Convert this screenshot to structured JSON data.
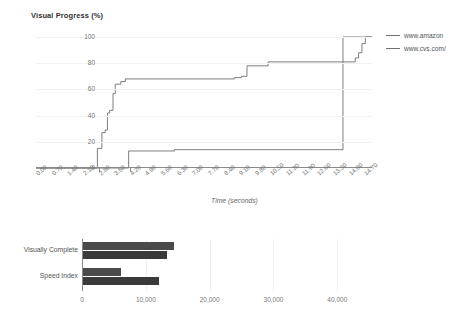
{
  "line_chart": {
    "title": "Visual Progress (%)",
    "xlabel": "Time (seconds)",
    "legend": [
      {
        "label": "www.amazon",
        "color": "#6f6f6f"
      },
      {
        "label": "www.cvs.com/",
        "color": "#6f6f6f"
      }
    ]
  },
  "bar_chart": {
    "title": "Timings (ms)",
    "legend": [
      {
        "label": "www.amaz...",
        "color": "#4a4a4a"
      },
      {
        "label": "www.cvs.co...",
        "color": "#3a3a3a"
      }
    ]
  },
  "chart_data": [
    {
      "type": "line",
      "title": "Visual Progress (%)",
      "xlabel": "Time (seconds)",
      "ylabel": "",
      "xlim": [
        0.0,
        15.05
      ],
      "ylim": [
        0,
        100
      ],
      "grid": true,
      "legend_position": "right",
      "xticks": [
        "0.00",
        "0.70",
        "1.40",
        "2.10",
        "2.80",
        "3.50",
        "4.20",
        "4.90",
        "5.60",
        "6.30",
        "7.00",
        "7.70",
        "8.40",
        "9.10",
        "9.80",
        "10.50",
        "11.20",
        "11.90",
        "12.60",
        "13.30",
        "14.00",
        "14.70"
      ],
      "yticks": [
        0,
        20,
        40,
        60,
        80,
        100
      ],
      "series": [
        {
          "name": "www.amazon",
          "color": "#6f6f6f",
          "step": "post",
          "points": [
            [
              0.0,
              0
            ],
            [
              2.75,
              0
            ],
            [
              2.75,
              15
            ],
            [
              2.95,
              15
            ],
            [
              2.95,
              27
            ],
            [
              3.1,
              27
            ],
            [
              3.1,
              29
            ],
            [
              3.2,
              29
            ],
            [
              3.2,
              42
            ],
            [
              3.3,
              42
            ],
            [
              3.3,
              44
            ],
            [
              3.45,
              44
            ],
            [
              3.45,
              57
            ],
            [
              3.55,
              57
            ],
            [
              3.55,
              64
            ],
            [
              3.8,
              64
            ],
            [
              3.8,
              66
            ],
            [
              4.0,
              66
            ],
            [
              4.0,
              68
            ],
            [
              8.9,
              68
            ],
            [
              8.9,
              69
            ],
            [
              9.2,
              69
            ],
            [
              9.2,
              70
            ],
            [
              9.45,
              70
            ],
            [
              9.45,
              78
            ],
            [
              10.4,
              78
            ],
            [
              10.4,
              81
            ],
            [
              13.75,
              81
            ],
            [
              13.75,
              100
            ],
            [
              15.05,
              100
            ]
          ]
        },
        {
          "name": "www.cvs.com/",
          "color": "#6f6f6f",
          "step": "post",
          "points": [
            [
              0.0,
              0
            ],
            [
              4.15,
              0
            ],
            [
              4.15,
              13
            ],
            [
              6.2,
              13
            ],
            [
              6.2,
              14
            ],
            [
              13.75,
              14
            ],
            [
              13.75,
              81
            ],
            [
              14.3,
              81
            ],
            [
              14.3,
              84
            ],
            [
              14.45,
              84
            ],
            [
              14.45,
              88
            ],
            [
              14.6,
              88
            ],
            [
              14.6,
              95
            ],
            [
              14.75,
              95
            ],
            [
              14.75,
              100
            ],
            [
              15.05,
              100
            ]
          ]
        }
      ]
    },
    {
      "type": "bar",
      "orientation": "horizontal",
      "title": "Timings (ms)",
      "xlabel": "",
      "ylabel": "",
      "xlim": [
        0,
        47000
      ],
      "grid": true,
      "legend_position": "right",
      "xticks": [
        0,
        10000,
        20000,
        30000,
        40000
      ],
      "xticklabels": [
        "0",
        "10,000",
        "20,000",
        "30,000",
        "40,000"
      ],
      "categories": [
        "Visually Complete",
        "Speed Index"
      ],
      "series": [
        {
          "name": "www.amaz...",
          "color": "#4a4a4a",
          "values": [
            14300,
            6000
          ]
        },
        {
          "name": "www.cvs.co...",
          "color": "#3a3a3a",
          "values": [
            13100,
            11900
          ]
        }
      ]
    }
  ]
}
